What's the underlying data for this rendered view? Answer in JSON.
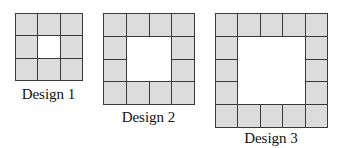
{
  "diagram": {
    "tile_color": "#dcdcdc",
    "line_color": "#3a3a3a",
    "designs": [
      {
        "label": "Design 1",
        "size": 3,
        "tiles": 8
      },
      {
        "label": "Design 2",
        "size": 4,
        "tiles": 12
      },
      {
        "label": "Design 3",
        "size": 5,
        "tiles": 16
      }
    ]
  }
}
